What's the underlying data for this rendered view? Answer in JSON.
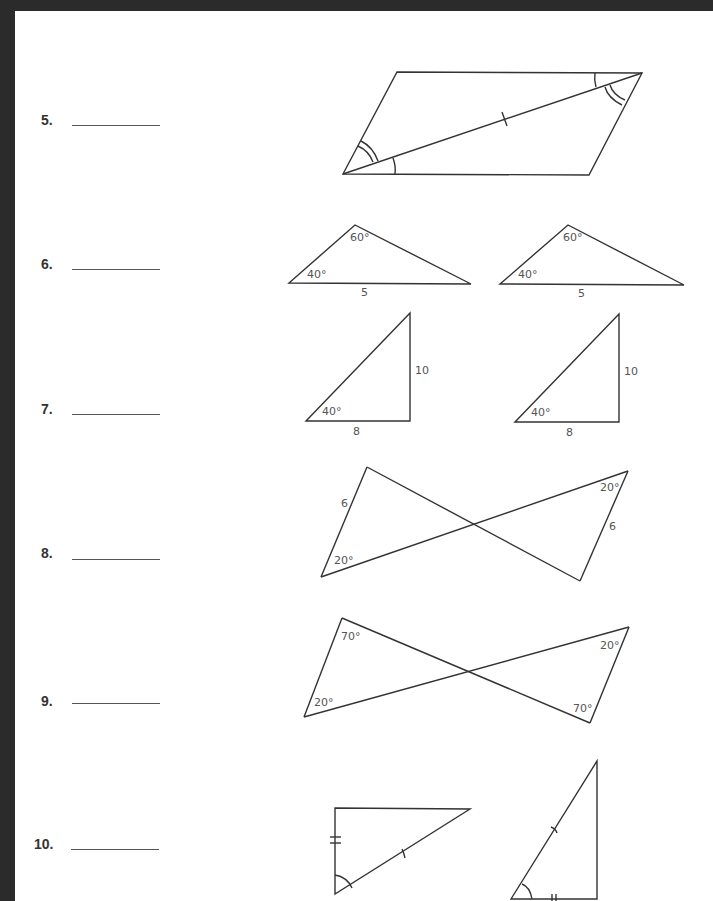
{
  "questions": [
    {
      "number": "5.",
      "answer": ""
    },
    {
      "number": "6.",
      "answer": ""
    },
    {
      "number": "7.",
      "answer": ""
    },
    {
      "number": "8.",
      "answer": ""
    },
    {
      "number": "9.",
      "answer": ""
    },
    {
      "number": "10.",
      "answer": ""
    }
  ],
  "figures": {
    "q6": {
      "top_angle": "60°",
      "left_angle": "40°",
      "base": "5"
    },
    "q7": {
      "angle": "40°",
      "base": "8",
      "height": "10"
    },
    "q8": {
      "left_side": "6",
      "left_angle": "20°",
      "right_angle": "20°",
      "right_side": "6"
    },
    "q9": {
      "top_left_angle": "70°",
      "bottom_left_angle": "20°",
      "top_right_angle": "20°",
      "bottom_right_angle": "70°"
    }
  }
}
